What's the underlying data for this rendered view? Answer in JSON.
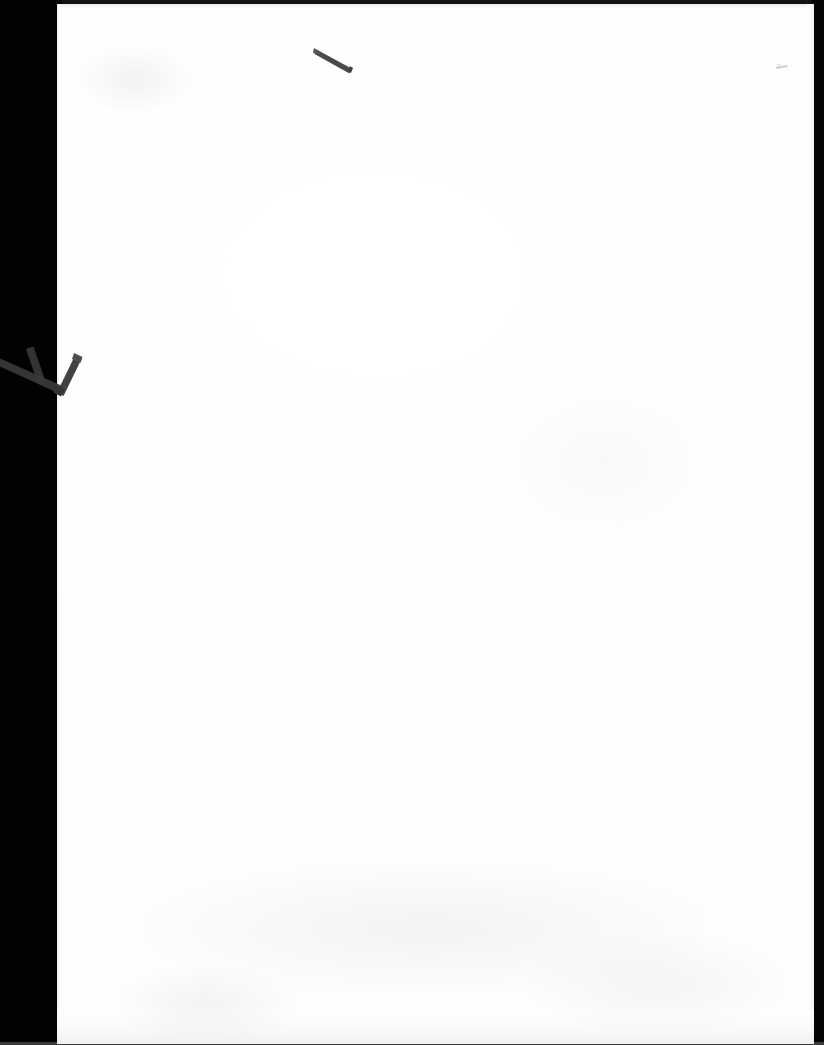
{
  "document": {
    "kind": "scanned-page",
    "page_state": "blank",
    "orientation": "portrait",
    "visible_text": "",
    "page_number_text": "",
    "header_text": "",
    "footer_text": "",
    "body_text": ""
  },
  "scan": {
    "background_label": "scanner-backing",
    "background_color": "#020202",
    "paper_color": "#ffffff",
    "paper_shade_color": "#fdfdfd",
    "edge_shadow_color": "#e4e4e4",
    "bottom_line_color": "#3a3a3a"
  },
  "marks": [
    {
      "id": "top-dash",
      "name": "pen-dash-mark",
      "description": "short dark diagonal pen stroke near top of page",
      "color": "#4a4a4a",
      "x": 316,
      "y": 48,
      "width": 36,
      "height": 22,
      "angle_deg": 25
    },
    {
      "id": "left-check",
      "name": "clip-check-mark",
      "description": "dark V / check shaped clip mark crossing the left page edge",
      "color": "#3f3f3f",
      "x": 0,
      "y": 350,
      "width": 82,
      "height": 48,
      "angle_deg": 0
    },
    {
      "id": "faint-speck",
      "name": "faint-speck-mark",
      "description": "very faint tiny gray speck near top right",
      "color": "#c9c9c9",
      "x": 778,
      "y": 68,
      "width": 12,
      "height": 5,
      "angle_deg": 10
    }
  ]
}
